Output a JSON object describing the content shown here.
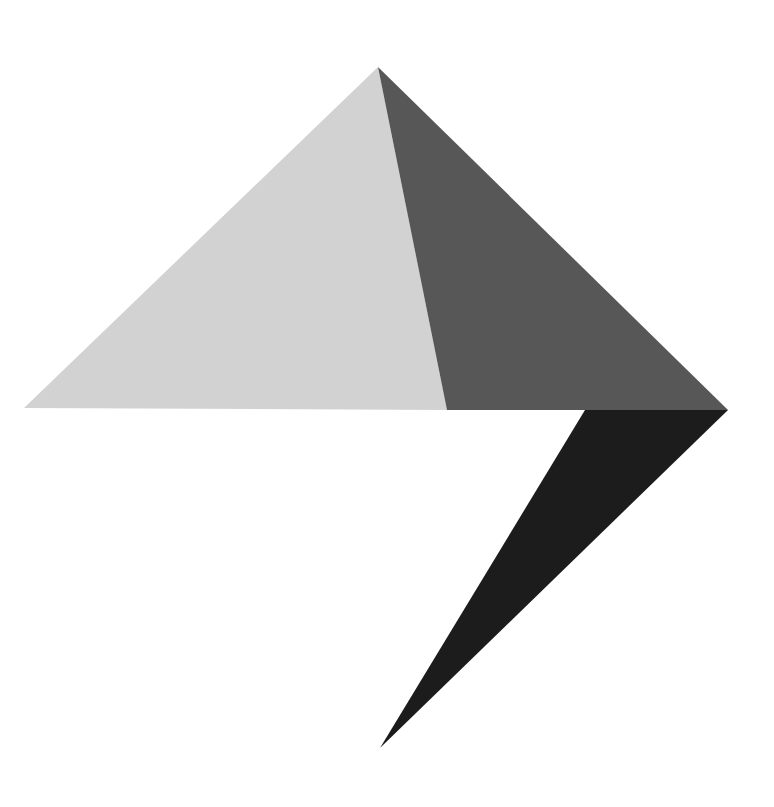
{
  "canvas": {
    "width": 774,
    "height": 807,
    "background_color": "#ffffff",
    "title": "Abstract Geometric Composition"
  },
  "palette": {
    "background": "#ffffff",
    "light_gray": "#d2d2d2",
    "medium_gray": "#575757",
    "near_black": "#1c1c1c"
  },
  "shapes": [
    {
      "id": "light-gray-triangle",
      "name": "Light gray left face",
      "fill": "#d2d2d2",
      "points": "378,67 24,408 447,410",
      "vertices": [
        {
          "x": 378,
          "y": 67,
          "label": "apex"
        },
        {
          "x": 24,
          "y": 408,
          "label": "left-corner"
        },
        {
          "x": 447,
          "y": 410,
          "label": "base-right"
        }
      ]
    },
    {
      "id": "dark-gray-triangle",
      "name": "Dark gray right face",
      "fill": "#575757",
      "points": "378,67 447,410 728,410",
      "vertices": [
        {
          "x": 378,
          "y": 67,
          "label": "apex"
        },
        {
          "x": 447,
          "y": 410,
          "label": "base-left"
        },
        {
          "x": 728,
          "y": 410,
          "label": "right-corner"
        }
      ]
    },
    {
      "id": "black-wedge",
      "name": "Near-black downward wedge",
      "fill": "#1c1c1c",
      "points": "585,410 728,410 380,748",
      "vertices": [
        {
          "x": 585,
          "y": 410,
          "label": "wedge-top-left"
        },
        {
          "x": 728,
          "y": 410,
          "label": "wedge-top-right"
        },
        {
          "x": 380,
          "y": 748,
          "label": "wedge-bottom-tip"
        }
      ]
    }
  ]
}
